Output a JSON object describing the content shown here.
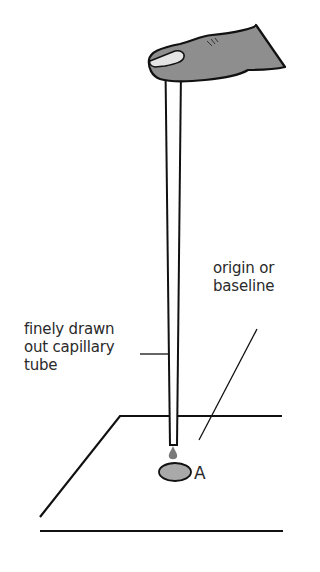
{
  "diagram": {
    "labels": {
      "capillary_tube": [
        "finely drawn",
        "out capillary",
        "tube"
      ],
      "origin": [
        "origin or",
        "baseline"
      ],
      "spot": "A"
    },
    "colors": {
      "stroke": "#111111",
      "finger_fill": "#8e8e8e",
      "nail_fill": "#e4e4e4",
      "spot_fill": "#a9a9a9",
      "drop_fill": "#7a7a7a",
      "text": "#2a2a2a",
      "background": "#ffffff"
    }
  }
}
